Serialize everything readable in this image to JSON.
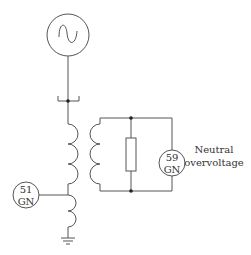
{
  "diagram": {
    "type": "single-line protection schematic",
    "generator": {
      "symbol": "ac-source",
      "glyph": "~"
    },
    "relays": [
      {
        "id": "relay-51gn",
        "line1": "51",
        "line2": "GN"
      },
      {
        "id": "relay-59gn",
        "line1": "59",
        "line2": "GN"
      }
    ],
    "labels": {
      "neutral_line1": "Neutral",
      "neutral_line2": "overvoltage"
    },
    "components": [
      "generator",
      "breaker",
      "grounding-transformer",
      "loading-resistor",
      "current-transformer",
      "ground"
    ],
    "colors": {
      "line": "#555555",
      "text": "#333333",
      "background": "#ffffff"
    }
  }
}
